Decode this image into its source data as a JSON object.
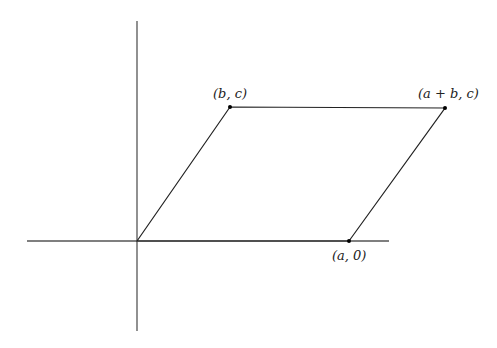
{
  "diagram": {
    "type": "parallelogram-on-axes",
    "axes": {
      "x_axis": {
        "x1": 27,
        "y": 241,
        "x2": 389
      },
      "y_axis": {
        "x": 137,
        "y1": 21,
        "y2": 331
      },
      "color": "#555555"
    },
    "vertices": [
      {
        "id": "origin",
        "x": 137,
        "y": 241,
        "label": ""
      },
      {
        "id": "b-c",
        "x": 230,
        "y": 107,
        "label": "(b, c)",
        "label_x": 213,
        "label_y": 98
      },
      {
        "id": "a-plus-b-c",
        "x": 445,
        "y": 108,
        "label": "(a + b, c)",
        "label_x": 418,
        "label_y": 98
      },
      {
        "id": "a-0",
        "x": 349,
        "y": 241,
        "label": "(a, 0)",
        "label_x": 332,
        "label_y": 260
      }
    ],
    "edge_color": "#222222",
    "dot_color": "#000000"
  }
}
